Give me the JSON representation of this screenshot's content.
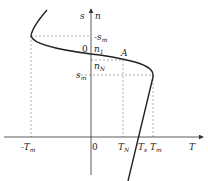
{
  "diagram": {
    "type": "torque-speed characteristic",
    "axes": {
      "vertical": {
        "labels": [
          "s",
          "n"
        ]
      },
      "horizontal": {
        "label": "T"
      }
    },
    "labels": {
      "s_axis": "s",
      "n_axis": "n",
      "T_axis": "T",
      "origin_top": "0",
      "origin_bottom": "0",
      "n1": "n",
      "n1_sub": "1",
      "nN": "n",
      "nN_sub": "N",
      "sm_top": "-s",
      "sm_top_sub": "m",
      "sm_right": "s",
      "sm_right_sub": "m",
      "point_A": "A",
      "neg_Tm": "-T",
      "neg_Tm_sub": "m",
      "TN": "T",
      "TN_sub": "N",
      "Ts": "T",
      "Ts_sub": "s",
      "Tm": "T",
      "Tm_sub": "m"
    },
    "colors": {
      "curve": "#222222",
      "axis": "#333333",
      "dashed": "#888888"
    }
  }
}
